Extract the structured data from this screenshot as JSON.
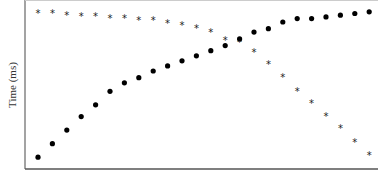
{
  "chart_data": {
    "type": "scatter",
    "title": "",
    "xlabel": "",
    "ylabel": "Time (ms)",
    "x": [
      1,
      2,
      3,
      4,
      5,
      6,
      7,
      8,
      9,
      10,
      11,
      12,
      13,
      14,
      15,
      16,
      17,
      18,
      19,
      20,
      21,
      22,
      23,
      24
    ],
    "xlim": [
      0,
      24.7
    ],
    "ylim": [
      0,
      100
    ],
    "grid": false,
    "legend": "none",
    "series": [
      {
        "name": "star-series",
        "marker": "star",
        "values": [
          92,
          92,
          91,
          90,
          90,
          89,
          89,
          88,
          88,
          86,
          85,
          83,
          81,
          76,
          75,
          69,
          62,
          54,
          46,
          39,
          31,
          24,
          16,
          8
        ]
      },
      {
        "name": "circle-series",
        "marker": "circle",
        "values": [
          7,
          15,
          23,
          31,
          38,
          46,
          51,
          54,
          58,
          61,
          64,
          67,
          70,
          73,
          77,
          81,
          83,
          87,
          89,
          89,
          90,
          91,
          92,
          93
        ]
      }
    ],
    "colors": {
      "marker": "#000000",
      "axis": "#555555"
    }
  }
}
